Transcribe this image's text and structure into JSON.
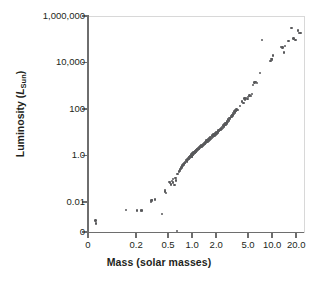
{
  "chart_data": {
    "type": "scatter",
    "title": "",
    "xlabel": "Mass (solar masses)",
    "ylabel": "Luminosity (L_Sun)",
    "ylabel_parts": {
      "prefix": "Luminosity (",
      "italic": "L",
      "subscript": "Sun",
      "suffix": ")"
    },
    "xscale": "log",
    "yscale": "log",
    "grid": false,
    "legend": null,
    "xlim": [
      0.05,
      25
    ],
    "ylim": [
      0.0005,
      1000000
    ],
    "xticks": [
      {
        "value": 0.05,
        "label": "0"
      },
      {
        "value": 0.2,
        "label": "0.2"
      },
      {
        "value": 0.5,
        "label": "0.5"
      },
      {
        "value": 1.0,
        "label": "1.0"
      },
      {
        "value": 2.0,
        "label": "2.0"
      },
      {
        "value": 5.0,
        "label": "5.0"
      },
      {
        "value": 10.0,
        "label": "10.0"
      },
      {
        "value": 20.0,
        "label": "20.0"
      }
    ],
    "yticks": [
      {
        "value": 1000000,
        "label": "1,000,000"
      },
      {
        "value": 10000,
        "label": "10,000"
      },
      {
        "value": 100,
        "label": "100"
      },
      {
        "value": 1.0,
        "label": "1.0"
      },
      {
        "value": 0.01,
        "label": "0.01"
      },
      {
        "value": 0.0005,
        "label": "0"
      }
    ],
    "marker": {
      "shape": "circle",
      "color": "#58595b",
      "size_px": 2.4
    },
    "point_count": 176,
    "points": [
      [
        0.062,
        0.0017
      ],
      [
        0.063,
        0.0013
      ],
      [
        0.148,
        0.0048
      ],
      [
        0.205,
        0.0047
      ],
      [
        0.228,
        0.0047
      ],
      [
        0.238,
        0.0047
      ],
      [
        0.305,
        0.011
      ],
      [
        0.312,
        0.0125
      ],
      [
        0.318,
        0.0135
      ],
      [
        0.345,
        0.014
      ],
      [
        0.42,
        0.0032
      ],
      [
        0.455,
        0.031
      ],
      [
        0.462,
        0.036
      ],
      [
        0.468,
        0.026
      ],
      [
        0.52,
        0.078
      ],
      [
        0.53,
        0.072
      ],
      [
        0.545,
        0.062
      ],
      [
        0.56,
        0.085
      ],
      [
        0.575,
        0.105
      ],
      [
        0.58,
        0.075
      ],
      [
        0.6,
        0.058
      ],
      [
        0.62,
        0.12
      ],
      [
        0.63,
        0.09
      ],
      [
        0.645,
        0.0006
      ],
      [
        0.66,
        0.17
      ],
      [
        0.68,
        0.22
      ],
      [
        0.7,
        0.27
      ],
      [
        0.705,
        0.24
      ],
      [
        0.72,
        0.3
      ],
      [
        0.74,
        0.33
      ],
      [
        0.76,
        0.41
      ],
      [
        0.78,
        0.47
      ],
      [
        0.79,
        0.44
      ],
      [
        0.8,
        0.52
      ],
      [
        0.82,
        0.55
      ],
      [
        0.835,
        0.62
      ],
      [
        0.85,
        0.68
      ],
      [
        0.86,
        0.6
      ],
      [
        0.875,
        0.72
      ],
      [
        0.89,
        0.78
      ],
      [
        0.9,
        0.82
      ],
      [
        0.91,
        0.88
      ],
      [
        0.92,
        0.75
      ],
      [
        0.93,
        0.95
      ],
      [
        0.94,
        0.9
      ],
      [
        0.95,
        1.0
      ],
      [
        0.955,
        1.05
      ],
      [
        0.96,
        0.96
      ],
      [
        0.965,
        1.1
      ],
      [
        0.97,
        1.02
      ],
      [
        0.975,
        1.15
      ],
      [
        0.98,
        1.0
      ],
      [
        0.985,
        1.2
      ],
      [
        0.99,
        1.08
      ],
      [
        0.995,
        1.25
      ],
      [
        1.0,
        1.0
      ],
      [
        1.0,
        1.3
      ],
      [
        1.01,
        1.18
      ],
      [
        1.02,
        1.35
      ],
      [
        1.03,
        1.22
      ],
      [
        1.04,
        1.45
      ],
      [
        1.05,
        1.3
      ],
      [
        1.06,
        1.5
      ],
      [
        1.07,
        1.38
      ],
      [
        1.08,
        1.6
      ],
      [
        1.09,
        1.42
      ],
      [
        1.1,
        1.7
      ],
      [
        1.1,
        1.55
      ],
      [
        1.11,
        1.8
      ],
      [
        1.12,
        1.62
      ],
      [
        1.13,
        1.9
      ],
      [
        1.14,
        1.72
      ],
      [
        1.15,
        2.0
      ],
      [
        1.16,
        1.85
      ],
      [
        1.17,
        2.1
      ],
      [
        1.18,
        1.95
      ],
      [
        1.19,
        2.2
      ],
      [
        1.2,
        2.05
      ],
      [
        1.21,
        2.35
      ],
      [
        1.22,
        2.15
      ],
      [
        1.23,
        2.5
      ],
      [
        1.25,
        2.3
      ],
      [
        1.26,
        2.7
      ],
      [
        1.28,
        2.45
      ],
      [
        1.3,
        2.9
      ],
      [
        1.31,
        2.6
      ],
      [
        1.33,
        3.1
      ],
      [
        1.35,
        2.8
      ],
      [
        1.37,
        3.4
      ],
      [
        1.39,
        3.0
      ],
      [
        1.4,
        3.7
      ],
      [
        1.42,
        3.3
      ],
      [
        1.44,
        4.0
      ],
      [
        1.46,
        3.6
      ],
      [
        1.48,
        4.4
      ],
      [
        1.5,
        3.9
      ],
      [
        1.52,
        4.8
      ],
      [
        1.55,
        4.3
      ],
      [
        1.57,
        5.3
      ],
      [
        1.6,
        4.7
      ],
      [
        1.62,
        5.8
      ],
      [
        1.65,
        5.2
      ],
      [
        1.68,
        6.4
      ],
      [
        1.7,
        5.7
      ],
      [
        1.73,
        7.0
      ],
      [
        1.76,
        6.3
      ],
      [
        1.8,
        7.8
      ],
      [
        1.83,
        7.0
      ],
      [
        1.86,
        8.6
      ],
      [
        1.9,
        7.8
      ],
      [
        1.93,
        9.5
      ],
      [
        1.96,
        8.6
      ],
      [
        2.0,
        10.5
      ],
      [
        2.03,
        9.5
      ],
      [
        2.07,
        11.5
      ],
      [
        2.1,
        10.5
      ],
      [
        2.14,
        13.0
      ],
      [
        2.18,
        12.0
      ],
      [
        2.22,
        14.5
      ],
      [
        2.26,
        13.5
      ],
      [
        2.3,
        16.0
      ],
      [
        2.34,
        15.0
      ],
      [
        2.38,
        18.0
      ],
      [
        2.42,
        17.0
      ],
      [
        2.46,
        21.0
      ],
      [
        2.5,
        19.0
      ],
      [
        2.55,
        24.0
      ],
      [
        2.6,
        22.0
      ],
      [
        2.62,
        28.0
      ],
      [
        2.68,
        26.0
      ],
      [
        2.72,
        32.0
      ],
      [
        2.78,
        30.0
      ],
      [
        2.82,
        38.0
      ],
      [
        2.88,
        35.0
      ],
      [
        2.93,
        45.0
      ],
      [
        3.0,
        42.0
      ],
      [
        3.05,
        55.0
      ],
      [
        3.1,
        50.0
      ],
      [
        3.15,
        62.0
      ],
      [
        3.2,
        58.0
      ],
      [
        3.25,
        72.0
      ],
      [
        3.3,
        66.0
      ],
      [
        3.38,
        85.0
      ],
      [
        3.45,
        78.0
      ],
      [
        3.5,
        95.0
      ],
      [
        3.55,
        88.0
      ],
      [
        3.6,
        105.0
      ],
      [
        3.7,
        98.0
      ],
      [
        4.0,
        150.0
      ],
      [
        4.2,
        230.0
      ],
      [
        4.4,
        195.0
      ],
      [
        4.5,
        310.0
      ],
      [
        4.6,
        280.0
      ],
      [
        4.75,
        330.0
      ],
      [
        4.9,
        300.0
      ],
      [
        5.0,
        360.0
      ],
      [
        5.2,
        420.0
      ],
      [
        5.4,
        390.0
      ],
      [
        5.6,
        480.0
      ],
      [
        5.8,
        1200.0
      ],
      [
        6.0,
        1500.0
      ],
      [
        6.2,
        1600.0
      ],
      [
        6.5,
        1450.0
      ],
      [
        7.0,
        3800.0
      ],
      [
        7.5,
        100000.0
      ],
      [
        9.5,
        13000.0
      ],
      [
        9.8,
        16000.0
      ],
      [
        10.0,
        15000.0
      ],
      [
        10.2,
        22000.0
      ],
      [
        13.0,
        52000.0
      ],
      [
        13.5,
        48000.0
      ],
      [
        14.0,
        30000.0
      ],
      [
        14.5,
        58000.0
      ],
      [
        16.0,
        95000.0
      ],
      [
        17.5,
        330000.0
      ],
      [
        18.5,
        120000.0
      ],
      [
        19.5,
        105000.0
      ],
      [
        21.0,
        260000.0
      ],
      [
        21.5,
        210000.0
      ],
      [
        22.5,
        200000.0
      ]
    ]
  }
}
